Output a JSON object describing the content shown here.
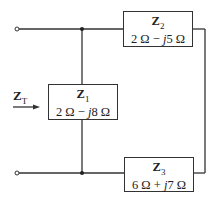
{
  "diagram": {
    "type": "circuit",
    "input_label": {
      "symbol": "Z",
      "subscript": "T"
    },
    "impedances": [
      {
        "id": "Z1",
        "symbol": "Z",
        "subscript": "1",
        "real": "2 Ω",
        "sign": "−",
        "j": "j",
        "imag": "8 Ω"
      },
      {
        "id": "Z2",
        "symbol": "Z",
        "subscript": "2",
        "real": "2 Ω",
        "sign": "−",
        "j": "j",
        "imag": "5 Ω"
      },
      {
        "id": "Z3",
        "symbol": "Z",
        "subscript": "3",
        "real": "6 Ω",
        "sign": "+",
        "j": "j",
        "imag": "7 Ω"
      }
    ],
    "topology": "Z1 in parallel with (Z2 in series with Z3) across input terminals"
  }
}
